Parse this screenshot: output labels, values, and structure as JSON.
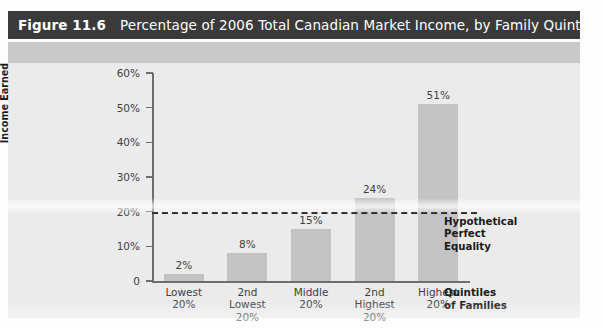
{
  "figure": {
    "number_label": "Figure 11.6",
    "title": "Percentage of 2006 Total Canadian Market Income, by Family Quintiles"
  },
  "colors": {
    "title_bar_bg": "#3a3a3a",
    "title_bar_text": "#ffffff",
    "panel_bg": "#ebebeb",
    "band_bg": "#c9c9c9",
    "bar_fill": "#c3c3c3",
    "axis": "#6e6e6e",
    "equality_line": "#1c1c1c",
    "text": "#3f3f3f"
  },
  "annotations": {
    "equality_note": "Hypothetical\nPerfect\nEquality"
  },
  "chart_data": {
    "type": "bar",
    "title": "Percentage of 2006 Total Canadian Market Income, by Family Quintiles",
    "xlabel": "Quintiles\nof Families",
    "ylabel": "Percentage of Total Market\nIncome Earned",
    "categories": [
      "Lowest\n20%",
      "2nd\nLowest\n20%",
      "Middle\n20%",
      "2nd\nHighest\n20%",
      "Highest\n20%"
    ],
    "values": [
      2,
      8,
      15,
      24,
      51
    ],
    "value_labels": [
      "2%",
      "8%",
      "15%",
      "24%",
      "51%"
    ],
    "ylim": [
      0,
      60
    ],
    "yticks": [
      0,
      10,
      20,
      30,
      40,
      50,
      60
    ],
    "ytick_labels": [
      "0",
      "10%",
      "20%",
      "30%",
      "40%",
      "50%",
      "60%"
    ],
    "grid": false,
    "legend": "none",
    "reference_lines": [
      {
        "name": "Hypothetical Perfect Equality",
        "value": 20,
        "style": "dashed",
        "label": "Hypothetical\nPerfect\nEquality"
      }
    ]
  }
}
